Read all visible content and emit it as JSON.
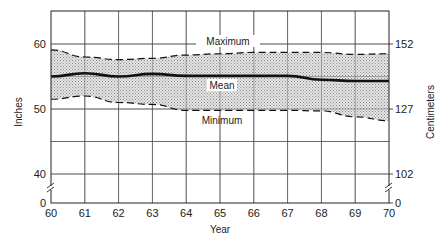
{
  "chart_data": {
    "type": "area",
    "title": "",
    "xlabel": "Year",
    "ylabel": "Inches",
    "ylabel_right": "Centimeters",
    "x": [
      60,
      61,
      62,
      63,
      64,
      65,
      66,
      67,
      68,
      69,
      70
    ],
    "xticks": [
      "60",
      "61",
      "62",
      "63",
      "64",
      "65",
      "66",
      "67",
      "68",
      "69",
      "70"
    ],
    "yticks_left": [
      "60",
      "50",
      "40",
      "0"
    ],
    "yticks_left_values": [
      60,
      50,
      40,
      0
    ],
    "yticks_right": [
      "152",
      "127",
      "102",
      "0"
    ],
    "yticks_right_values_inches": [
      60,
      50,
      40,
      0
    ],
    "ylim": [
      37.5,
      65
    ],
    "axis_break": true,
    "grid": true,
    "legend": "inline labels",
    "series": [
      {
        "name": "Maximum",
        "style": "dashed",
        "values": [
          59.1,
          58.0,
          57.6,
          57.8,
          58.3,
          58.5,
          58.7,
          58.7,
          58.7,
          58.4,
          58.5
        ]
      },
      {
        "name": "Mean",
        "style": "solid-bold",
        "values": [
          55.0,
          55.5,
          55.0,
          55.4,
          55.1,
          55.1,
          55.1,
          55.1,
          54.5,
          54.3,
          54.3
        ]
      },
      {
        "name": "Minimum",
        "style": "dashed",
        "values": [
          51.5,
          52.0,
          51.0,
          50.7,
          49.8,
          49.8,
          49.8,
          49.8,
          49.7,
          48.8,
          48.2
        ]
      }
    ],
    "band": {
      "between": [
        "Minimum",
        "Maximum"
      ],
      "fill": "stippled gray"
    },
    "annotations": [
      {
        "text": "Maximum",
        "x": 65,
        "y": 60
      },
      {
        "text": "Mean",
        "x": 65,
        "y": 53.3
      },
      {
        "text": "Minimum",
        "x": 65,
        "y": 48.3
      }
    ]
  },
  "labels": {
    "xlabel": "Year",
    "ylabel_left": "Inches",
    "ylabel_right": "Centimeters",
    "maximum": "Maximum",
    "mean": "Mean",
    "minimum": "Minimum"
  },
  "colors": {
    "line": "#111111",
    "grid": "#555555",
    "band": "#c8c8c8"
  }
}
